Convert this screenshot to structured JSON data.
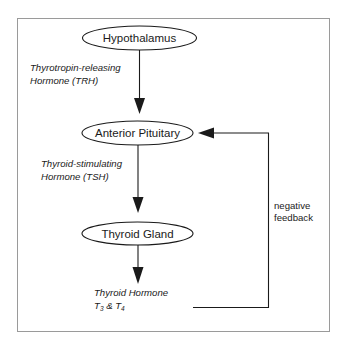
{
  "diagram": {
    "nodes": [
      {
        "id": "hypothalamus",
        "label": "Hypothalamus"
      },
      {
        "id": "anterior_pituitary",
        "label": "Anterior Pituitary"
      },
      {
        "id": "thyroid_gland",
        "label": "Thyroid Gland"
      }
    ],
    "edges": [
      {
        "from": "hypothalamus",
        "to": "anterior_pituitary",
        "label_line1": "Thyrotropin-releasing",
        "label_line2": "Hormone (TRH)"
      },
      {
        "from": "anterior_pituitary",
        "to": "thyroid_gland",
        "label_line1": "Thyroid-stimulating",
        "label_line2": "Hormone (TSH)"
      },
      {
        "from": "thyroid_gland",
        "to": "thyroid_hormone"
      }
    ],
    "output": {
      "line1": "Thyroid Hormone",
      "t_prefix": "T",
      "t3_sub": "3",
      "amp": " & ",
      "t4_sub": "4"
    },
    "feedback": {
      "label_line1": "negative",
      "label_line2": "feedback",
      "from": "thyroid_hormone",
      "to": "anterior_pituitary"
    },
    "colors": {
      "stroke": "#1a1a1a",
      "frame": "#9a9a9a",
      "background": "#ffffff"
    }
  }
}
